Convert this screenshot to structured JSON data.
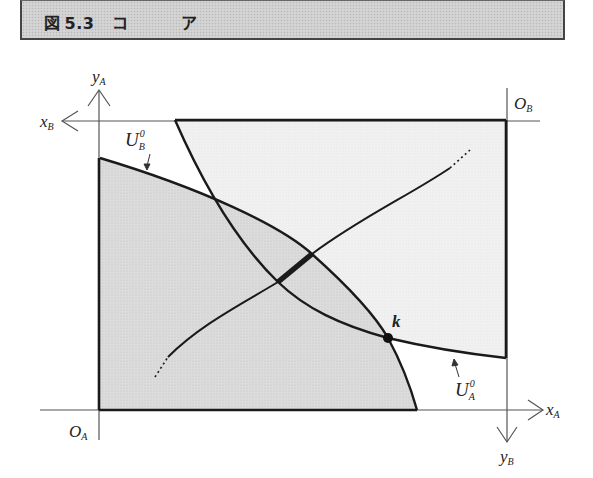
{
  "title_bar": {
    "figure_prefix": "図",
    "figure_number": "5.3",
    "title_char_1": "コ",
    "title_char_2": "ア"
  },
  "diagram": {
    "type": "edgeworth-box",
    "labels": {
      "origin_a": "O",
      "origin_a_sub": "A",
      "origin_b": "O",
      "origin_b_sub": "B",
      "x_a": "x",
      "x_a_sub": "A",
      "y_a": "y",
      "y_a_sub": "A",
      "x_b": "x",
      "x_b_sub": "B",
      "y_b": "y",
      "y_b_sub": "B",
      "indiff_a": "U",
      "indiff_a_sub": "A",
      "indiff_a_sup": "0",
      "indiff_b": "U",
      "indiff_b_sub": "B",
      "indiff_b_sup": "0",
      "endowment_point": "k"
    },
    "colors": {
      "region_fill": "#d9d9d9",
      "line": "#1a1a1a",
      "axis": "#555555"
    }
  }
}
